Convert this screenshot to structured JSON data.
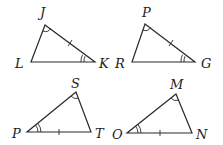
{
  "diagram": {
    "triangles": [
      {
        "name": "JLK",
        "vertices": {
          "J": "J",
          "L": "L",
          "K": "K"
        },
        "marks": {
          "single_arc": "J",
          "double_arc": "K",
          "tick_side": "JK"
        }
      },
      {
        "name": "PRG",
        "vertices": {
          "P": "P",
          "R": "R",
          "G": "G"
        },
        "marks": {
          "single_arc": "P",
          "double_arc": "G",
          "tick_side": "PG"
        }
      },
      {
        "name": "SPT",
        "vertices": {
          "S": "S",
          "P": "P",
          "T": "T"
        },
        "marks": {
          "single_arc": "S",
          "double_arc": "P",
          "tick_side": "PT"
        }
      },
      {
        "name": "MON",
        "vertices": {
          "M": "M",
          "O": "O",
          "N": "N"
        },
        "marks": {
          "single_arc": "M",
          "double_arc": "O",
          "tick_side": "ON"
        }
      }
    ],
    "colors": {
      "stroke": "#2a2a2a",
      "text": "#222222",
      "background": "#ffffff"
    }
  }
}
